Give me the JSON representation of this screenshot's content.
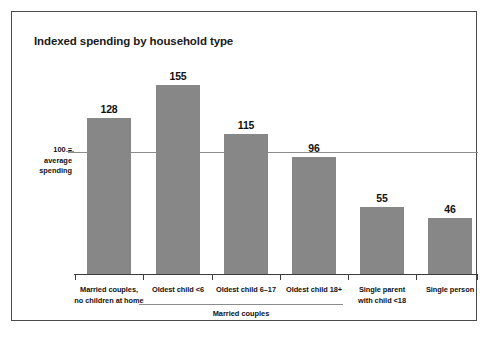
{
  "chart_data": {
    "type": "bar",
    "title": "Indexed spending by household type",
    "xlabel": "",
    "ylabel": "",
    "ylim": [
      0,
      178
    ],
    "grid": false,
    "legend": null,
    "reference_line": {
      "value": 100,
      "label_line1": "100 =",
      "label_line2": "average",
      "label_line3": "spending"
    },
    "group_label": "Married couples",
    "grouped_categories": [
      "Oldest child <6",
      "Oldest child 6–17",
      "Oldest child 18+"
    ],
    "categories": [
      "Married couples, no children at home",
      "Oldest child <6",
      "Oldest child 6–17",
      "Oldest child 18+",
      "Single parent with child <18",
      "Single person"
    ],
    "category_lines": [
      [
        "Married couples,",
        "no children at home"
      ],
      [
        "Oldest child <6"
      ],
      [
        "Oldest child 6–17"
      ],
      [
        "Oldest child 18+"
      ],
      [
        "Single parent",
        "with child <18"
      ],
      [
        "Single person"
      ]
    ],
    "values": [
      128,
      155,
      115,
      96,
      55,
      46
    ],
    "value_labels": [
      "128",
      "155",
      "115",
      "96",
      "55",
      "46"
    ],
    "colors": {
      "bar_fill": "#878787",
      "axis": "#3d3d3d",
      "reference_line": "#8c8c8c",
      "frame": "#4a4a4a",
      "background": "#ffffff",
      "text": "#111111"
    }
  }
}
